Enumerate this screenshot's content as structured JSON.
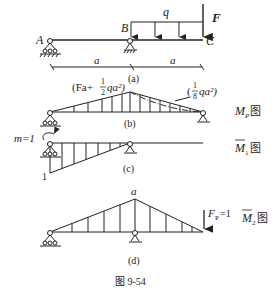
{
  "figure": {
    "caption": "图 9-54",
    "stroke_color": "#222222",
    "background": "#ffffff"
  },
  "panel_a": {
    "sublabel": "(a)",
    "points": {
      "A": "A",
      "B": "B",
      "C": "C"
    },
    "load_q": "q",
    "force_F": "F",
    "dim_left": "a",
    "dim_right": "a"
  },
  "panel_b": {
    "sublabel": "(b)",
    "peak_label_prefix": "(Fa+",
    "peak_frac_num": "1",
    "peak_frac_den": "2",
    "peak_label_suffix": "qa²)",
    "mid_label_prefix": "(",
    "mid_frac_num": "1",
    "mid_frac_den": "8",
    "mid_label_suffix": "qa²)",
    "diagram_name": "M",
    "diagram_sub": "P",
    "diagram_suffix": "图"
  },
  "panel_c": {
    "sublabel": "(c)",
    "moment_label": "m=1",
    "value_label": "1",
    "diagram_name": "M",
    "diagram_sub": "1",
    "diagram_suffix": "图"
  },
  "panel_d": {
    "sublabel": "(d)",
    "peak_label": "a",
    "force_label": "F",
    "force_sub": "P",
    "force_value": "=1",
    "diagram_name": "M",
    "diagram_sub": "2",
    "diagram_suffix": "图"
  }
}
